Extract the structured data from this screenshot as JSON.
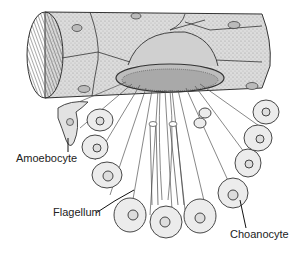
{
  "diagram": {
    "labels": {
      "amoebocyte": "Amoebocyte",
      "flagellum": "Flagellum",
      "choanocyte": "Choanocyte"
    },
    "colors": {
      "line": "#333333",
      "fill_light": "#e6e6e6",
      "fill_mid": "#c8c8c8",
      "background": "#ffffff"
    }
  }
}
